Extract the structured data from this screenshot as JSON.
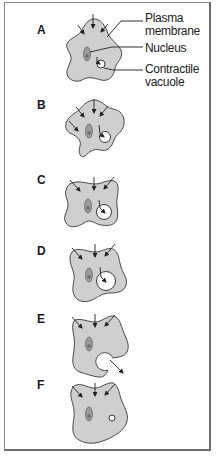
{
  "figure": {
    "callouts": {
      "plasma_membrane_line1": "Plasma",
      "plasma_membrane_line2": "membrane",
      "nucleus": "Nucleus",
      "contractile_vacuole_line1": "Contractile",
      "contractile_vacuole_line2": "vacuole"
    },
    "steps": [
      {
        "label": "A",
        "stage": "small vacuole forming"
      },
      {
        "label": "B",
        "stage": "vacuole filling"
      },
      {
        "label": "C",
        "stage": "vacuole enlarging"
      },
      {
        "label": "D",
        "stage": "vacuole full size"
      },
      {
        "label": "E",
        "stage": "vacuole expels water"
      },
      {
        "label": "F",
        "stage": "new small vacuole"
      }
    ],
    "colors": {
      "cytoplasm": "#cfcfcf",
      "outline": "#4a4a4a",
      "nucleus": "#9a9a9a",
      "nucleolus": "#6a6a6a",
      "vacuole": "#ffffff",
      "frame": "#8a8a8a"
    }
  }
}
